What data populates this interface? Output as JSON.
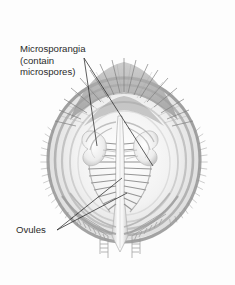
{
  "figure": {
    "name": "conifer-cone-longitudinal-section",
    "background_color": "#fdfdfd",
    "ink_color": "#6e6e6e",
    "leader_color": "#1a1a1a",
    "text_color": "#2b2b2b"
  },
  "labels": [
    {
      "id": "microsporangia",
      "name": "microsporangia-label",
      "lines": [
        "Microsporangia",
        "(contain",
        "microspores)"
      ],
      "x": 20,
      "y": 52,
      "line_height": 11.5,
      "leaders": [
        {
          "from": [
            84,
            58
          ],
          "to": [
            97,
            146
          ]
        },
        {
          "from": [
            84,
            58
          ],
          "to": [
            153,
            166
          ]
        }
      ]
    },
    {
      "id": "ovules",
      "name": "ovules-label",
      "lines": [
        "Ovules"
      ],
      "x": 16,
      "y": 233,
      "line_height": 11.5,
      "leaders": [
        {
          "from": [
            57,
            230
          ],
          "to": [
            122,
            178
          ]
        },
        {
          "from": [
            57,
            230
          ],
          "to": [
            127,
            193
          ]
        }
      ]
    }
  ],
  "structures": [
    {
      "name": "crown-bracts",
      "description": "radiating bristly bracts across the top of the cone"
    },
    {
      "name": "outer-cone-rings",
      "description": "concentric arcs forming the outer wall of the cone"
    },
    {
      "name": "central-axis",
      "description": "pale vertical columnar axis through the middle"
    },
    {
      "name": "microsporangium-left",
      "description": "pale lobed pollen sac on the left of the axis"
    },
    {
      "name": "microsporangium-right",
      "description": "pale lobed pollen sac on the right of the axis"
    },
    {
      "name": "ovule-rows-left",
      "description": "ladder-like horizontal ovule rows left of the axis"
    },
    {
      "name": "ovule-rows-right",
      "description": "ladder-like horizontal ovule rows right of the axis"
    },
    {
      "name": "basal-fringe-scales",
      "description": "comb-like fringed scales splaying downward at the base"
    }
  ]
}
